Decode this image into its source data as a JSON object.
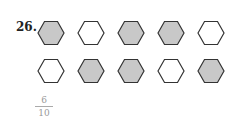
{
  "problem": {
    "number": "26.",
    "answer": {
      "numerator": "6",
      "denominator": "10"
    },
    "colors": {
      "shaded": "#c8c8c8",
      "unshaded": "#ffffff",
      "stroke": "#333333"
    },
    "rows": [
      [
        "shaded",
        "unshaded",
        "shaded",
        "shaded",
        "unshaded"
      ],
      [
        "unshaded",
        "shaded",
        "shaded",
        "unshaded",
        "shaded"
      ]
    ]
  }
}
